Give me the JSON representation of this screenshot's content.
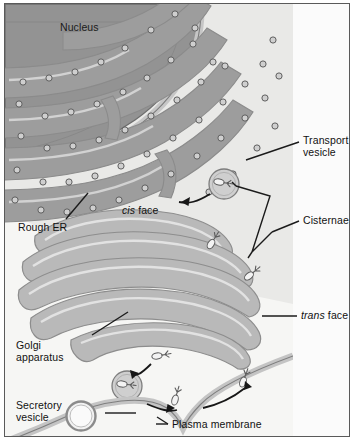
{
  "figure": {
    "title_alt": "Endomembrane system: rough ER, Golgi apparatus and secretory pathway",
    "palette": {
      "cytosol": "#f2f2f0",
      "cytosol_upper": "#e8e8e6",
      "nucleus_fill": "#8f8f8f",
      "nucleus_edge": "#6f6f6f",
      "er_lumen": "#9a9a9a",
      "er_membrane": "#c8c8c8",
      "golgi_lumen": "#b4b4b4",
      "golgi_membrane": "#dcdcdc",
      "ribosome": "#7b7b7b",
      "vesicle_edge": "#8a8a8a",
      "line": "#1b1b1b",
      "frame": "#5a5a5a",
      "text": "#111111"
    }
  },
  "labels": {
    "nucleus": "Nucleus",
    "rough_er": "Rough ER",
    "cis_face_em": "cis",
    "cis_face_rest": " face",
    "trans_face_em": "trans",
    "trans_face_rest": " face",
    "transport_vesicle": "Transport\nvesicle",
    "cisternae": "Cisternae",
    "golgi_apparatus": "Golgi\napparatus",
    "secretory_vesicle": "Secretory\nvesicle",
    "plasma_membrane": "Plasma membrane"
  }
}
